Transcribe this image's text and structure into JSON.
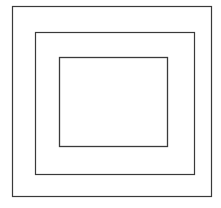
{
  "figure": {
    "title": "Concentric Rectangles",
    "canvas": {
      "width": 221,
      "height": 208,
      "background_color": "#ffffff"
    },
    "stroke_color": "#3a3a3a",
    "fill_color": "none",
    "shape_count": 3,
    "shapes": [
      {
        "name": "outer-rectangle",
        "label": "Outer rectangle",
        "x": 12,
        "y": 6,
        "width": 199,
        "height": 190,
        "stroke_color": "#3a3a3a",
        "stroke_width": 1.2,
        "fill": "none"
      },
      {
        "name": "middle-rectangle",
        "label": "Middle rectangle",
        "x": 35,
        "y": 32,
        "width": 159,
        "height": 142,
        "stroke_color": "#3a3a3a",
        "stroke_width": 1.2,
        "fill": "none"
      },
      {
        "name": "inner-rectangle",
        "label": "Inner rectangle",
        "x": 59,
        "y": 57,
        "width": 108,
        "height": 89,
        "stroke_color": "#3a3a3a",
        "stroke_width": 1.3,
        "fill": "none"
      }
    ]
  }
}
